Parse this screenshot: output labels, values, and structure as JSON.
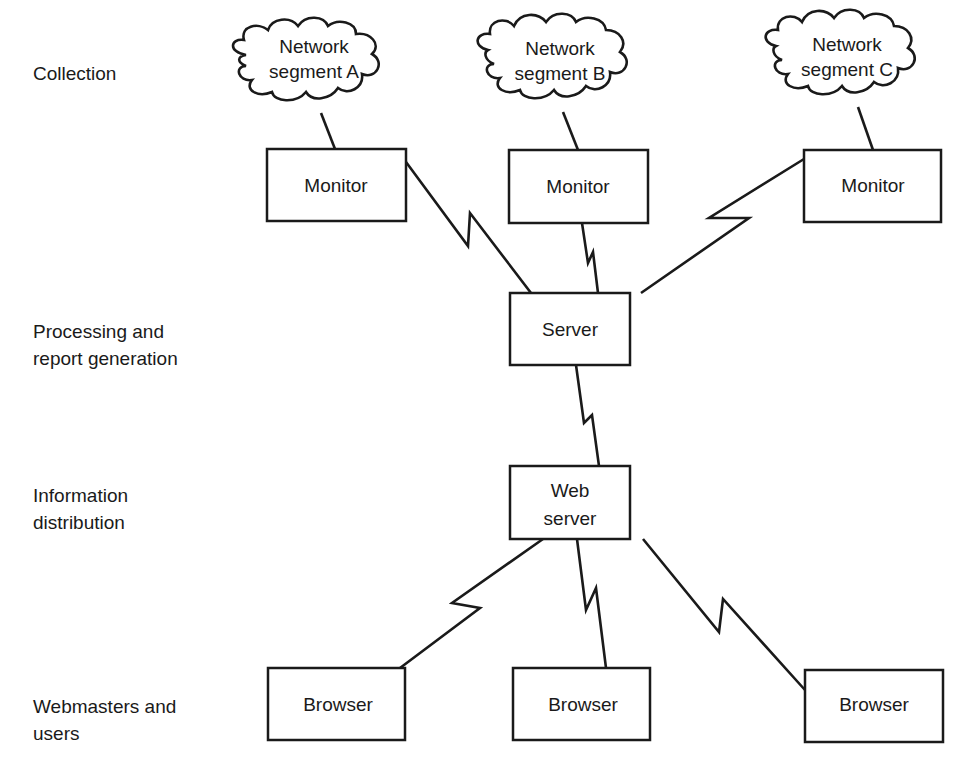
{
  "diagram": {
    "tiers": [
      {
        "id": "collection",
        "label": "Collection"
      },
      {
        "id": "processing",
        "label": "Processing and\nreport generation"
      },
      {
        "id": "distribution",
        "label": "Information\ndistribution"
      },
      {
        "id": "users",
        "label": "Webmasters and\nusers"
      }
    ],
    "clouds": [
      {
        "id": "segment-a",
        "lines": [
          "Network",
          "segment A"
        ]
      },
      {
        "id": "segment-b",
        "lines": [
          "Network",
          "segment B"
        ]
      },
      {
        "id": "segment-c",
        "lines": [
          "Network",
          "segment C"
        ]
      }
    ],
    "nodes": [
      {
        "id": "monitor-a",
        "lines": [
          "Monitor"
        ]
      },
      {
        "id": "monitor-b",
        "lines": [
          "Monitor"
        ]
      },
      {
        "id": "monitor-c",
        "lines": [
          "Monitor"
        ]
      },
      {
        "id": "server",
        "lines": [
          "Server"
        ]
      },
      {
        "id": "web-server",
        "lines": [
          "Web",
          "server"
        ]
      },
      {
        "id": "browser-1",
        "lines": [
          "Browser"
        ]
      },
      {
        "id": "browser-2",
        "lines": [
          "Browser"
        ]
      },
      {
        "id": "browser-3",
        "lines": [
          "Browser"
        ]
      }
    ],
    "edges": [
      {
        "from": "segment-a",
        "to": "monitor-a",
        "type": "straight"
      },
      {
        "from": "segment-b",
        "to": "monitor-b",
        "type": "straight"
      },
      {
        "from": "segment-c",
        "to": "monitor-c",
        "type": "straight"
      },
      {
        "from": "monitor-a",
        "to": "server",
        "type": "wan-link"
      },
      {
        "from": "monitor-b",
        "to": "server",
        "type": "wan-link"
      },
      {
        "from": "monitor-c",
        "to": "server",
        "type": "wan-link"
      },
      {
        "from": "server",
        "to": "web-server",
        "type": "wan-link"
      },
      {
        "from": "web-server",
        "to": "browser-1",
        "type": "wan-link"
      },
      {
        "from": "web-server",
        "to": "browser-2",
        "type": "wan-link"
      },
      {
        "from": "web-server",
        "to": "browser-3",
        "type": "wan-link"
      }
    ]
  }
}
